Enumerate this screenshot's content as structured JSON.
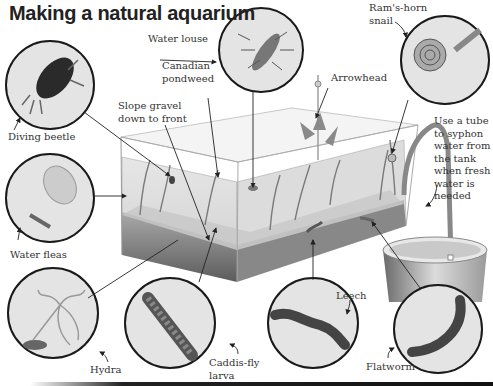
{
  "title": "Making a natural aquarium",
  "labels": {
    "water_louse": "Water louse",
    "rams_horn_snail_line1": "Ram's-horn",
    "rams_horn_snail_line2": "snail",
    "canadian_pondweed_line1": "Canadian",
    "canadian_pondweed_line2": "pondweed",
    "arrowhead": "Arrowhead",
    "diving_beetle": "Diving beetle",
    "slope_gravel_line1": "Slope gravel",
    "slope_gravel_line2": "down to front",
    "syphon_note_lines": [
      "Use a tube",
      "to syphon",
      "water from",
      "the tank",
      "when fresh",
      "water is",
      "needed"
    ],
    "water_fleas": "Water fleas",
    "leech": "Leech",
    "hydra": "Hydra",
    "caddis_fly_line1": "Caddis-fly",
    "caddis_fly_line2": "larva",
    "flatworm": "Flatworm"
  },
  "colors": {
    "circle_fill": "#e4e4e4",
    "circle_stroke": "#1a1a1a",
    "water": "#d9d9d9",
    "gravel": "#8a8a8a",
    "plant": "#7d7d7d",
    "text": "#333333"
  }
}
